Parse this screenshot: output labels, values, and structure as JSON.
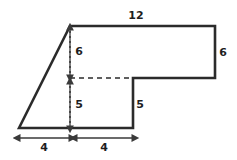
{
  "figure": {
    "kind": "composite-polygon-dimensioned-diagram",
    "background_color": "#ffffff",
    "outline_color": "#2b2b2b",
    "guide_color": "#3a3a3a",
    "label_color": "#1e1e1e",
    "outline_width": 2.6,
    "guide_width": 1.3
  },
  "shape": {
    "name": "L-shaped figure with slanted left side",
    "vertices": [
      {
        "id": "bottom-left",
        "x": 19,
        "y": 128
      },
      {
        "id": "top-left",
        "x": 70,
        "y": 26
      },
      {
        "id": "top-right",
        "x": 215,
        "y": 26
      },
      {
        "id": "right-bottom",
        "x": 215,
        "y": 78
      },
      {
        "id": "notch-left",
        "x": 133,
        "y": 78
      },
      {
        "id": "notch-bottom",
        "x": 133,
        "y": 128
      }
    ],
    "path": "M 19 128 L 70 26 L 215 26 L 215 78 L 133 78 L 133 128 Z"
  },
  "guides": {
    "dashed_horizontal": {
      "name": "interior-dashed-divider",
      "x1": 70,
      "y1": 78,
      "x2": 133,
      "y2": 78,
      "dash": "5,4"
    },
    "dotted_vertical": {
      "name": "interior-dotted-divider",
      "x1": 70,
      "y1": 26,
      "x2": 70,
      "y2": 128,
      "dash": "2,3"
    }
  },
  "dimensions": [
    {
      "id": "top-width",
      "label": "12",
      "orientation": "horizontal",
      "label_x": 136,
      "label_y": 16,
      "arrow": null,
      "describes": "top edge length"
    },
    {
      "id": "right-height",
      "label": "6",
      "orientation": "vertical",
      "label_x": 223,
      "label_y": 53,
      "arrow": null,
      "describes": "right edge height"
    },
    {
      "id": "upper-interior-height",
      "label": "6",
      "orientation": "vertical",
      "label_x": 79,
      "label_y": 52,
      "arrow": {
        "x1": 70,
        "y1": 30,
        "x2": 70,
        "y2": 75,
        "double": true
      },
      "describes": "upper vertical interior segment"
    },
    {
      "id": "lower-interior-height",
      "label": "5",
      "orientation": "vertical",
      "label_x": 79,
      "label_y": 105,
      "arrow": {
        "x1": 70,
        "y1": 84,
        "x2": 70,
        "y2": 126,
        "double": true
      },
      "describes": "lower vertical interior segment"
    },
    {
      "id": "notch-height",
      "label": "5",
      "orientation": "vertical",
      "label_x": 140,
      "label_y": 105,
      "arrow": null,
      "describes": "inner vertical edge height"
    },
    {
      "id": "bottom-left-width",
      "label": "4",
      "orientation": "horizontal",
      "label_x": 44,
      "label_y": 148,
      "arrow": {
        "x1": 20,
        "y1": 138,
        "x2": 69,
        "y2": 138,
        "double": true
      },
      "describes": "left base span"
    },
    {
      "id": "bottom-right-width",
      "label": "4",
      "orientation": "horizontal",
      "label_x": 104,
      "label_y": 148,
      "arrow": {
        "x1": 77,
        "y1": 138,
        "x2": 132,
        "y2": 138,
        "double": true
      },
      "describes": "right base span"
    }
  ]
}
